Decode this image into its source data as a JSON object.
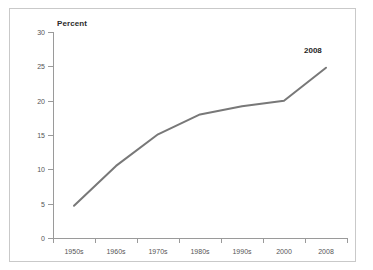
{
  "figure": {
    "title": "",
    "title_visible": false
  },
  "chart_data": {
    "type": "line",
    "title": "",
    "xlabel": "",
    "ylabel": "Percent",
    "categories": [
      "1950s",
      "1960s",
      "1970s",
      "1980s",
      "1990s",
      "2000",
      "2008"
    ],
    "values": [
      4.7,
      10.5,
      15.1,
      18.0,
      19.2,
      20.0,
      24.8
    ],
    "series": [
      {
        "name": "Percent",
        "values": [
          4.7,
          10.5,
          15.1,
          18.0,
          19.2,
          20.0,
          24.8
        ],
        "color": "#787878"
      }
    ],
    "ylim": [
      0,
      30
    ],
    "yticks": [
      0,
      5,
      10,
      15,
      20,
      25,
      30
    ],
    "ytick_labels": [
      "0",
      "5",
      "10",
      "15",
      "20",
      "25",
      "30"
    ],
    "grid": false,
    "legend": false,
    "annotations": [
      {
        "text": "2008",
        "category": "2008",
        "value": 24.8
      }
    ]
  },
  "colors": {
    "line": "#787878",
    "axis": "#9a9a9a",
    "frame": "#c9c9c9",
    "tick_text": "#555555",
    "annotation_text": "#1f1f1f"
  }
}
